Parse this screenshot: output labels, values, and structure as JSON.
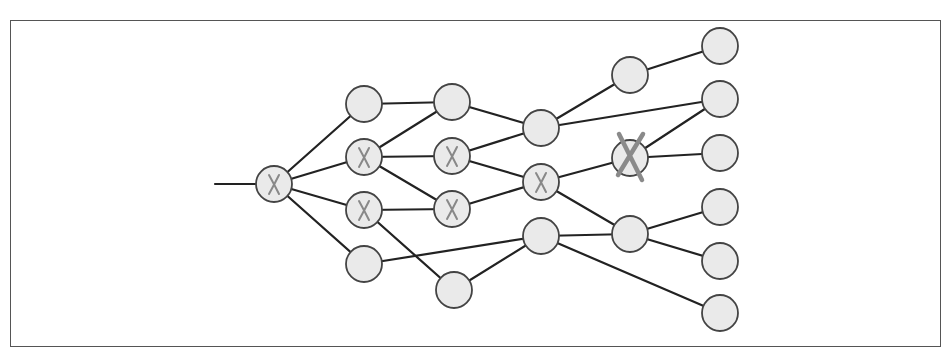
{
  "diagram": {
    "title": "",
    "style": {
      "node_fill": "#eaeaea",
      "node_stroke": "#444444",
      "edge_color": "#222222",
      "mark_color": "#888888",
      "node_radius": 18
    },
    "input_edge": {
      "from": [
        215,
        184
      ],
      "to": "root"
    },
    "nodes": [
      {
        "id": "root",
        "x": 274,
        "y": 184,
        "mark": "small-x"
      },
      {
        "id": "c1a",
        "x": 364,
        "y": 104,
        "mark": "none"
      },
      {
        "id": "c1b",
        "x": 364,
        "y": 157,
        "mark": "small-x"
      },
      {
        "id": "c1c",
        "x": 364,
        "y": 210,
        "mark": "small-x"
      },
      {
        "id": "c1d",
        "x": 364,
        "y": 264,
        "mark": "none"
      },
      {
        "id": "c2a",
        "x": 452,
        "y": 102,
        "mark": "none"
      },
      {
        "id": "c2b",
        "x": 452,
        "y": 156,
        "mark": "small-x"
      },
      {
        "id": "c2c",
        "x": 452,
        "y": 209,
        "mark": "small-x"
      },
      {
        "id": "c2d",
        "x": 454,
        "y": 290,
        "mark": "none"
      },
      {
        "id": "c3a",
        "x": 541,
        "y": 128,
        "mark": "none"
      },
      {
        "id": "c3b",
        "x": 541,
        "y": 182,
        "mark": "small-x"
      },
      {
        "id": "c3c",
        "x": 541,
        "y": 236,
        "mark": "none"
      },
      {
        "id": "c4a",
        "x": 630,
        "y": 75,
        "mark": "none"
      },
      {
        "id": "c4b",
        "x": 630,
        "y": 158,
        "mark": "big-x"
      },
      {
        "id": "c4c",
        "x": 630,
        "y": 234,
        "mark": "none"
      },
      {
        "id": "c5a",
        "x": 720,
        "y": 46,
        "mark": "none"
      },
      {
        "id": "c5b",
        "x": 720,
        "y": 99,
        "mark": "none"
      },
      {
        "id": "c5c",
        "x": 720,
        "y": 153,
        "mark": "none"
      },
      {
        "id": "c5d",
        "x": 720,
        "y": 207,
        "mark": "none"
      },
      {
        "id": "c5e",
        "x": 720,
        "y": 261,
        "mark": "none"
      },
      {
        "id": "c5f",
        "x": 720,
        "y": 313,
        "mark": "none"
      }
    ],
    "edges": [
      [
        "root",
        "c1a"
      ],
      [
        "root",
        "c1b"
      ],
      [
        "root",
        "c1c"
      ],
      [
        "root",
        "c1d"
      ],
      [
        "c1a",
        "c2a"
      ],
      [
        "c1b",
        "c2a"
      ],
      [
        "c1b",
        "c2b"
      ],
      [
        "c1b",
        "c2c"
      ],
      [
        "c1c",
        "c2c"
      ],
      [
        "c1c",
        "c2d"
      ],
      [
        "c1d",
        "c3c"
      ],
      [
        "c2a",
        "c3a"
      ],
      [
        "c2b",
        "c3a"
      ],
      [
        "c2b",
        "c3b"
      ],
      [
        "c2c",
        "c3b"
      ],
      [
        "c2d",
        "c3c"
      ],
      [
        "c3a",
        "c4a"
      ],
      [
        "c3a",
        "c5b"
      ],
      [
        "c3b",
        "c4b"
      ],
      [
        "c3b",
        "c4c"
      ],
      [
        "c3c",
        "c4c"
      ],
      [
        "c3c",
        "c5f"
      ],
      [
        "c4a",
        "c5a"
      ],
      [
        "c4b",
        "c5b"
      ],
      [
        "c4b",
        "c5c"
      ],
      [
        "c4c",
        "c5d"
      ],
      [
        "c4c",
        "c5e"
      ]
    ]
  }
}
